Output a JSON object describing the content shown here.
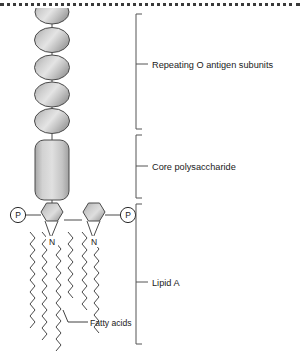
{
  "figure": {
    "top_border_style": "dotted"
  },
  "colors": {
    "shape_fill_light": "#e2e2e2",
    "shape_fill_mid": "#b9b9b9",
    "shape_fill_dark": "#9a9a9a",
    "outline": "#2b2b2b",
    "bracket": "#555555",
    "text": "#1a1a1a",
    "background": "#ffffff"
  },
  "brackets": [
    {
      "id": "o-antigen",
      "label": "Repeating O antigen subunits",
      "top": 14,
      "bottom": 129,
      "tick_y": 64,
      "label_x": 152,
      "label_y": 67
    },
    {
      "id": "core-polysaccharide",
      "label": "Core polysaccharide",
      "top": 135,
      "bottom": 198,
      "tick_y": 166,
      "label_x": 152,
      "label_y": 169
    },
    {
      "id": "lipid-a",
      "label": "Lipid A",
      "top": 204,
      "bottom": 344,
      "tick_y": 282,
      "label_x": 152,
      "label_y": 285
    }
  ],
  "o_antigen": {
    "unit_shape": "oval",
    "center_x": 52,
    "units": [
      {
        "cy": 14,
        "rx": 17,
        "ry": 12,
        "clipped": true
      },
      {
        "cy": 40,
        "rx": 17.5,
        "ry": 12.5,
        "clipped": false
      },
      {
        "cy": 68,
        "rx": 17.5,
        "ry": 12.5,
        "clipped": false
      },
      {
        "cy": 95,
        "rx": 17.5,
        "ry": 12.5,
        "clipped": false
      },
      {
        "cy": 121,
        "rx": 17.5,
        "ry": 12.5,
        "clipped": false
      }
    ],
    "connector_segments": [
      {
        "x": 52,
        "y1": 24,
        "y2": 29
      },
      {
        "x": 52,
        "y1": 52,
        "y2": 57
      },
      {
        "x": 52,
        "y1": 79,
        "y2": 84
      },
      {
        "x": 52,
        "y1": 106,
        "y2": 110
      },
      {
        "x": 52,
        "y1": 132,
        "y2": 140
      }
    ]
  },
  "core_polysaccharide": {
    "shape": "rounded-rectangle",
    "x": 35,
    "y": 140,
    "width": 34,
    "height": 60,
    "corner_radius": 9,
    "stem_top": {
      "x": 52,
      "y1": 132,
      "y2": 140
    },
    "stem_bottom": {
      "x": 52,
      "y1": 200,
      "y2": 209
    }
  },
  "lipid_a": {
    "sugars": [
      {
        "id": "glucosamine-left",
        "cx": 52,
        "cy": 218,
        "radius": 13
      },
      {
        "id": "glucosamine-right",
        "cx": 94,
        "cy": 218,
        "radius": 13
      }
    ],
    "sugar_link": {
      "x1": 63,
      "y1": 221,
      "x2": 83,
      "y2": 221
    },
    "phosphates": [
      {
        "id": "phosphate-left",
        "cx": 18,
        "cy": 215,
        "r": 7.5,
        "glyph": "P",
        "bond_x1": 25,
        "bond_y1": 215,
        "bond_x2": 41,
        "bond_y2": 215
      },
      {
        "id": "phosphate-right",
        "cx": 128,
        "cy": 215,
        "r": 7.5,
        "glyph": "P",
        "bond_x1": 105,
        "bond_y1": 215,
        "bond_x2": 120,
        "bond_y2": 215
      }
    ],
    "nitrogen_labels": [
      {
        "id": "n-left",
        "text": "N",
        "x": 52,
        "y": 243
      },
      {
        "id": "n-right",
        "text": "N",
        "x": 94,
        "y": 243
      }
    ],
    "fatty_acids": [
      {
        "id": "chain-1",
        "x": 29,
        "top": 232,
        "bottom": 330,
        "amplitude": 4.0,
        "period": 11
      },
      {
        "id": "chain-2",
        "x": 42,
        "top": 232,
        "bottom": 342,
        "amplitude": 4.0,
        "period": 11
      },
      {
        "id": "chain-3",
        "x": 55,
        "top": 243,
        "bottom": 352,
        "amplitude": 4.0,
        "period": 11
      },
      {
        "id": "chain-4",
        "x": 66,
        "top": 232,
        "bottom": 300,
        "amplitude": 4.0,
        "period": 11
      },
      {
        "id": "chain-5",
        "x": 80,
        "top": 232,
        "bottom": 310,
        "amplitude": 4.0,
        "period": 11
      },
      {
        "id": "chain-6",
        "x": 92,
        "top": 243,
        "bottom": 332,
        "amplitude": 4.0,
        "period": 11
      }
    ],
    "fatty_acid_callout": {
      "label": "Fatty acids",
      "label_x": 73,
      "label_y": 325,
      "leader_from_x": 55,
      "leader_from_y": 325,
      "leader_to_x": 71,
      "leader_to_y": 325,
      "leader_elbow_x": 66,
      "leader_elbow_y": 311
    }
  }
}
